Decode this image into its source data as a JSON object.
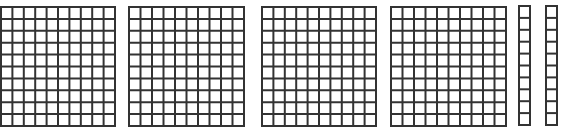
{
  "diagram": {
    "type": "base-ten-blocks",
    "line_color": "#333333",
    "fill_color": "#ffffff",
    "flats": [
      {
        "name": "hundred-flat-1",
        "x": 0,
        "y": 6,
        "w": 116,
        "h": 121,
        "cols": 10,
        "rows": 10
      },
      {
        "name": "hundred-flat-2",
        "x": 128,
        "y": 6,
        "w": 117,
        "h": 121,
        "cols": 10,
        "rows": 10
      },
      {
        "name": "hundred-flat-3",
        "x": 261,
        "y": 6,
        "w": 116,
        "h": 121,
        "cols": 10,
        "rows": 10
      },
      {
        "name": "hundred-flat-4",
        "x": 390,
        "y": 6,
        "w": 117,
        "h": 121,
        "cols": 10,
        "rows": 10
      }
    ],
    "rods": [
      {
        "name": "ten-rod-1",
        "x": 518,
        "y": 5,
        "w": 13,
        "h": 121,
        "cols": 1,
        "rows": 10
      },
      {
        "name": "ten-rod-2",
        "x": 545,
        "y": 5,
        "w": 13,
        "h": 121,
        "cols": 1,
        "rows": 10
      }
    ],
    "represented_value": 420
  }
}
